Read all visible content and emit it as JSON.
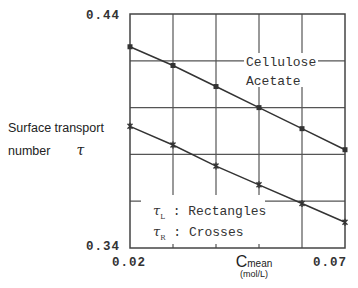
{
  "y_axis": {
    "label_line1": "Surface transport",
    "label_line2": "number",
    "symbol": "τ",
    "tick_top": "0.44",
    "tick_bottom": "0.34"
  },
  "x_axis": {
    "tick_left": "0.02",
    "tick_right": "0.07",
    "title_main": "C",
    "title_sub": "mean",
    "title_unit": "(mol/L)"
  },
  "annotation": {
    "line1": "Cellulose",
    "line2": "Acetate"
  },
  "legend": {
    "item1_symbol": "τ",
    "item1_sub": "L",
    "item1_text": ": Rectangles",
    "item2_symbol": "τ",
    "item2_sub": "R",
    "item2_text": ": Crosses"
  },
  "colors": {
    "line": "#333333",
    "grid": "#555555",
    "frame": "#444444"
  },
  "chart_data": {
    "type": "line",
    "title": "",
    "xlabel": "C_mean (mol/L)",
    "ylabel": "Surface transport number τ",
    "xlim": [
      0.02,
      0.07
    ],
    "ylim": [
      0.34,
      0.44
    ],
    "x_gridlines": [
      0.03,
      0.04,
      0.05,
      0.06
    ],
    "y_gridlines": [
      0.36,
      0.38,
      0.4,
      0.42
    ],
    "grid": true,
    "x_tick_labels": [
      "0.02",
      "0.07"
    ],
    "y_tick_labels": [
      "0.34",
      "0.44"
    ],
    "annotations": [
      "Cellulose Acetate",
      "τL : Rectangles",
      "τR : Crosses"
    ],
    "x": [
      0.02,
      0.03,
      0.04,
      0.05,
      0.06,
      0.07
    ],
    "series": [
      {
        "name": "τL (Rectangles)",
        "marker": "rectangle",
        "values": [
          0.426,
          0.418,
          0.409,
          0.4,
          0.391,
          0.382
        ]
      },
      {
        "name": "τR (Crosses)",
        "marker": "cross",
        "values": [
          0.392,
          0.384,
          0.375,
          0.367,
          0.359,
          0.351
        ]
      }
    ]
  }
}
